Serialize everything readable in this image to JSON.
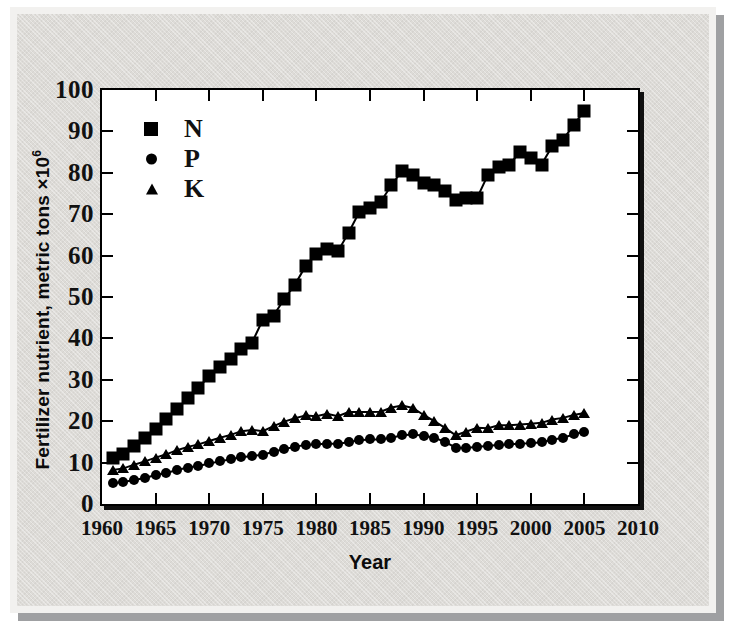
{
  "figure": {
    "panel_bg": "#dddbd7",
    "panel_border": "#f2f1ef",
    "shadow_color": "#9fa0a2",
    "ink_color": "#000000"
  },
  "axes": {
    "y_title_main": "Fertilizer nutrient, metric tons ×10",
    "y_title_exponent": "6",
    "x_title": "Year",
    "y_ticks": [
      "100",
      "90",
      "80",
      "70",
      "60",
      "50",
      "40",
      "30",
      "20",
      "10",
      "0"
    ],
    "x_ticks": [
      "1960",
      "1965",
      "1970",
      "1975",
      "1980",
      "1985",
      "1990",
      "1995",
      "2000",
      "2005",
      "2010"
    ]
  },
  "legend": {
    "entries": [
      {
        "label": "N",
        "marker": "square-icon"
      },
      {
        "label": "P",
        "marker": "circle-icon"
      },
      {
        "label": "K",
        "marker": "triangle-icon"
      }
    ]
  },
  "chart_data": {
    "type": "line",
    "title": "",
    "xlabel": "Year",
    "ylabel": "Fertilizer nutrient, metric tons ×10^6",
    "xlim": [
      1960,
      2010
    ],
    "ylim": [
      0,
      100
    ],
    "ytick_interval": 10,
    "xtick_interval": 5,
    "grid": false,
    "legend_position": "upper-left-inside",
    "x": [
      1961,
      1962,
      1963,
      1964,
      1965,
      1966,
      1967,
      1968,
      1969,
      1970,
      1971,
      1972,
      1973,
      1974,
      1975,
      1976,
      1977,
      1978,
      1979,
      1980,
      1981,
      1982,
      1983,
      1984,
      1985,
      1986,
      1987,
      1988,
      1989,
      1990,
      1991,
      1992,
      1993,
      1994,
      1995,
      1996,
      1997,
      1998,
      1999,
      2000,
      2001,
      2002,
      2003,
      2004,
      2005
    ],
    "series": [
      {
        "name": "N",
        "marker": "square",
        "values": [
          11.0,
          12.0,
          14.0,
          16.0,
          18.0,
          20.5,
          23.0,
          25.5,
          28.0,
          31.0,
          33.0,
          35.0,
          37.5,
          39.0,
          44.5,
          45.5,
          49.5,
          53.0,
          57.5,
          60.5,
          61.5,
          61.0,
          65.5,
          70.5,
          71.5,
          73.0,
          77.0,
          80.5,
          79.5,
          77.5,
          77.0,
          75.5,
          73.5,
          74.0,
          74.0,
          79.5,
          81.5,
          82.0,
          85.0,
          83.5,
          82.0,
          86.5,
          88.0,
          91.5,
          95.0
        ]
      },
      {
        "name": "P",
        "marker": "circle",
        "values": [
          5.0,
          5.3,
          5.8,
          6.3,
          7.0,
          7.5,
          8.2,
          8.8,
          9.2,
          9.8,
          10.3,
          10.8,
          11.3,
          11.6,
          11.9,
          12.6,
          13.3,
          13.8,
          14.3,
          14.4,
          14.6,
          14.5,
          15.0,
          15.4,
          15.6,
          15.6,
          16.0,
          16.6,
          16.8,
          16.5,
          16.0,
          15.0,
          13.6,
          13.5,
          13.8,
          14.0,
          14.3,
          14.4,
          14.6,
          14.7,
          14.9,
          15.5,
          16.0,
          16.8,
          17.5
        ]
      },
      {
        "name": "K",
        "marker": "triangle",
        "values": [
          8.2,
          8.6,
          9.5,
          10.3,
          11.2,
          12.0,
          13.0,
          13.8,
          14.4,
          15.2,
          16.0,
          16.7,
          17.6,
          17.9,
          17.6,
          18.8,
          19.9,
          20.7,
          21.4,
          21.2,
          21.8,
          21.2,
          22.2,
          22.2,
          22.2,
          22.3,
          23.3,
          23.8,
          23.2,
          21.5,
          20.0,
          18.4,
          16.6,
          17.5,
          18.4,
          18.3,
          19.0,
          19.0,
          19.2,
          19.4,
          19.6,
          20.4,
          20.8,
          21.5,
          22.0
        ]
      }
    ]
  }
}
